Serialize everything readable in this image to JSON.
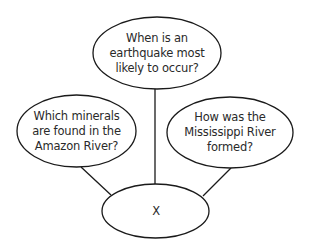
{
  "diagram": {
    "type": "concept-web",
    "stroke_color": "#1a1a1a",
    "text_color": "#2a2a2a",
    "background": "#ffffff",
    "center_node": {
      "id": "center",
      "label": "X"
    },
    "nodes": [
      {
        "id": "top",
        "label": "When is an earthquake most likely to occur?",
        "lines": [
          "When is an",
          "earthquake most",
          "likely to occur?"
        ]
      },
      {
        "id": "left",
        "label": "Which minerals are found in the Amazon River?",
        "lines": [
          "Which minerals",
          "are found in the",
          "Amazon River?"
        ]
      },
      {
        "id": "right",
        "label": "How was the Mississippi River formed?",
        "lines": [
          "How was the",
          "Mississippi River",
          "formed?"
        ]
      }
    ],
    "edges": [
      {
        "from": "top",
        "to": "center"
      },
      {
        "from": "left",
        "to": "center"
      },
      {
        "from": "right",
        "to": "center"
      }
    ]
  }
}
